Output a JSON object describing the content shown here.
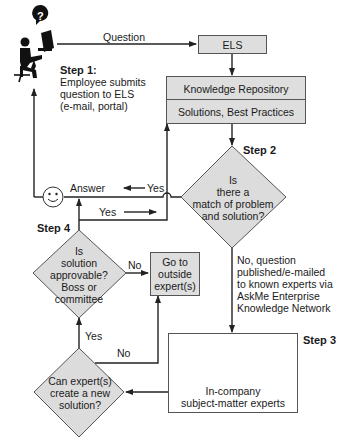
{
  "diagram": {
    "colors": {
      "box_fill": "#dedede",
      "line": "#222222",
      "border": "#555555",
      "background": "#ffffff"
    },
    "edges": {
      "question": "Question",
      "answer": "Answer",
      "yes_answer": "Yes",
      "yes_to_repo": "Yes",
      "no_outside": "No",
      "yes_approve": "Yes",
      "no_new": "No"
    },
    "steps": {
      "step1": {
        "label": "Step 1:",
        "lines": [
          "Employee submits",
          "question to ELS",
          "(e-mail, portal)"
        ]
      },
      "step2": {
        "label": "Step 2",
        "lines": [
          "Is",
          "there a",
          "match of problem",
          "and solution?"
        ]
      },
      "step3": {
        "label": "Step 3",
        "no_path_lines": [
          "No, question",
          "published/e-mailed",
          "to known experts via",
          "AskMe Enterprise",
          "Knowledge Network"
        ]
      },
      "step4": {
        "label": "Step 4",
        "lines": [
          "Is",
          "solution",
          "approvable?",
          "Boss or",
          "committee"
        ]
      }
    },
    "nodes": {
      "els": "ELS",
      "repository_top": "Knowledge Repository",
      "repository_bottom": "Solutions, Best Practices",
      "outside_expert": [
        "Go to",
        "outside",
        "expert(s)"
      ],
      "experts_box": [
        "In-company",
        "subject-matter experts"
      ],
      "new_solution": [
        "Can expert(s)",
        "create a new",
        "solution?"
      ]
    },
    "icons": [
      "employee-at-computer-icon",
      "question-bubble-icon",
      "smiley-face-icon",
      "expert-person-icon",
      "exclamation-bubble-icon"
    ]
  }
}
